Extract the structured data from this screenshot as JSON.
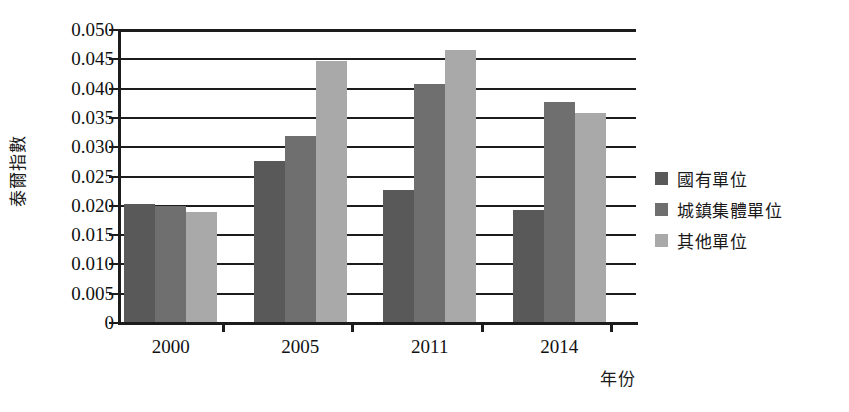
{
  "chart_data": {
    "type": "bar",
    "title": "",
    "xlabel": "年份",
    "ylabel": "泰爾指數",
    "categories": [
      "2000",
      "2005",
      "2011",
      "2014"
    ],
    "series": [
      {
        "name": "國有單位",
        "color": "#595959",
        "values": [
          0.0202,
          0.0275,
          0.0225,
          0.0192
        ]
      },
      {
        "name": "城鎮集體單位",
        "color": "#6f6f6f",
        "values": [
          0.0198,
          0.0317,
          0.0407,
          0.0376
        ]
      },
      {
        "name": "其他單位",
        "color": "#a9a9a9",
        "values": [
          0.0188,
          0.0445,
          0.0465,
          0.0357
        ]
      }
    ],
    "ylim": [
      0,
      0.05
    ],
    "ytick_labels": [
      "0.050",
      "0.045",
      "0.040",
      "0.035",
      "0.030",
      "0.025",
      "0.020",
      "0.015",
      "0.010",
      "0.005",
      "0"
    ],
    "ytick_values": [
      0.05,
      0.045,
      0.04,
      0.035,
      0.03,
      0.025,
      0.02,
      0.015,
      0.01,
      0.005,
      0
    ],
    "grid": true,
    "legend_position": "right"
  },
  "legend": {
    "items": [
      {
        "label": "國有單位"
      },
      {
        "label": "城鎮集體單位"
      },
      {
        "label": "其他單位"
      }
    ]
  },
  "caption": ""
}
